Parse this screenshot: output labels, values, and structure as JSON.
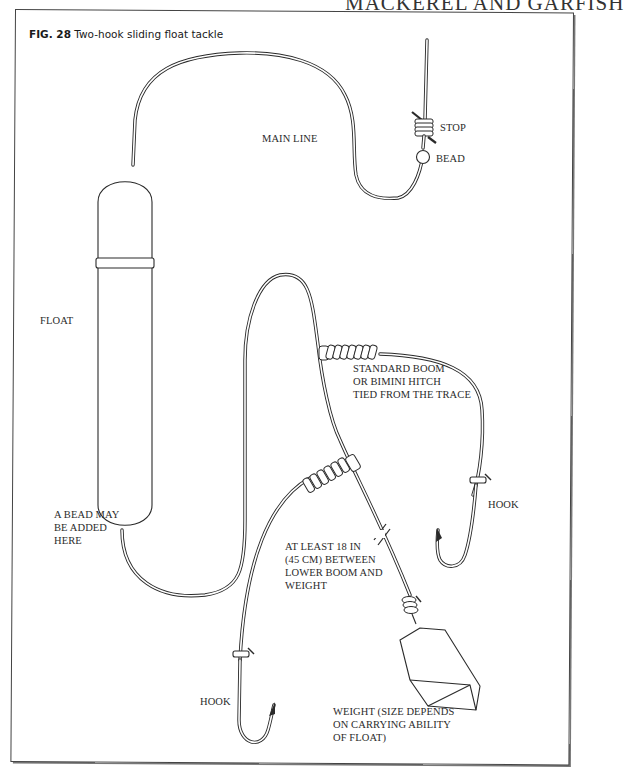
{
  "running_head": "MACKEREL AND GARFISH",
  "figure": {
    "number": "FIG. 28",
    "title": "Two-hook sliding float tackle"
  },
  "labels": {
    "stop": "STOP",
    "bead": "BEAD",
    "main_line": "MAIN LINE",
    "float": "FLOAT",
    "bead_note": [
      "A BEAD MAY",
      "BE ADDED",
      "HERE"
    ],
    "boom_note": [
      "STANDARD BOOM",
      "OR BIMINI HITCH",
      "TIED FROM THE TRACE"
    ],
    "hook_right": "HOOK",
    "distance_note": [
      "AT LEAST 18 IN",
      "(45 CM) BETWEEN",
      "LOWER BOOM AND",
      "WEIGHT"
    ],
    "hook_lower": "HOOK",
    "weight_note": [
      "WEIGHT (SIZE DEPENDS",
      "ON CARRYING ABILITY",
      "OF FLOAT)"
    ]
  },
  "colors": {
    "ink": "#2a2a2a",
    "paper": "#ffffff"
  }
}
